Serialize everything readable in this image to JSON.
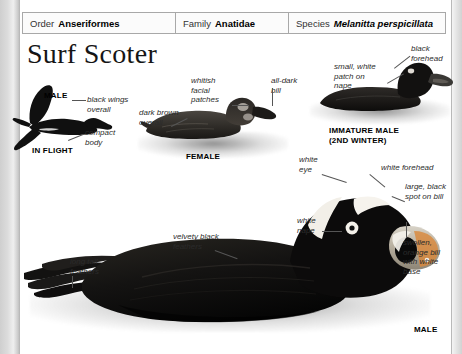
{
  "page": {
    "title": "Surf Scoter",
    "background_color": "#ffffff",
    "margin_color": "#d9d9d9"
  },
  "taxonomy_header": {
    "cells": [
      {
        "rank": "Order",
        "name": "Anseriformes",
        "italic": false
      },
      {
        "rank": "Family",
        "name": "Anatidae",
        "italic": false
      },
      {
        "rank": "Species",
        "name": "Melanitta perspicillata",
        "italic": true
      }
    ]
  },
  "figures": [
    {
      "id": "in-flight-male",
      "caption": "IN FLIGHT",
      "sex_label": "MALE",
      "callouts": [
        {
          "text": "black wings\noverall"
        },
        {
          "text": "compact\nbody"
        }
      ]
    },
    {
      "id": "female-swimming",
      "caption": "FEMALE",
      "callouts": [
        {
          "text": "whitish\nfacial\npatches"
        },
        {
          "text": "all-dark\nbill"
        },
        {
          "text": "dark brown\noverall"
        }
      ]
    },
    {
      "id": "immature-male",
      "caption": "IMMATURE MALE\n(2ND WINTER)",
      "callouts": [
        {
          "text": "small, white\npatch on\nnape"
        },
        {
          "text": "black\nforehead"
        }
      ]
    },
    {
      "id": "adult-male-swimming",
      "caption": "MALE",
      "callouts": [
        {
          "text": "white\neye"
        },
        {
          "text": "white forehead"
        },
        {
          "text": "large, black\nspot on bill"
        },
        {
          "text": "swollen,\norange bill\nwith white\nbase"
        },
        {
          "text": "white\nnape"
        },
        {
          "text": "velvety black\nfeathers"
        },
        {
          "text": "long tail\nfeathers"
        }
      ]
    }
  ],
  "labels": {
    "flight_male": "MALE",
    "flight_black_wings": "black wings\noverall",
    "flight_compact_body": "compact\nbody",
    "flight_caption": "IN FLIGHT",
    "female_whitish_patches": "whitish\nfacial\npatches",
    "female_all_dark_bill": "all-dark\nbill",
    "female_dark_brown": "dark brown\noverall",
    "female_caption": "FEMALE",
    "immature_white_patch": "small, white\npatch on\nnape",
    "immature_black_forehead": "black\nforehead",
    "immature_caption": "IMMATURE MALE\n(2ND WINTER)",
    "male_white_eye": "white\neye",
    "male_white_forehead": "white forehead",
    "male_black_spot": "large, black\nspot on bill",
    "male_orange_bill": "swollen,\norange bill\nwith white\nbase",
    "male_white_nape": "white\nnape",
    "male_velvety_feathers": "velvety black\nfeathers",
    "male_long_tail": "long tail\nfeathers",
    "male_caption": "MALE"
  }
}
